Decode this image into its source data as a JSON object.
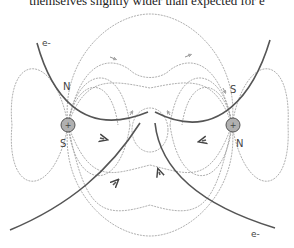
{
  "caption": "themselves slightly wider than expected for e",
  "diagram": {
    "labels": {
      "electron_top_left": "e-",
      "electron_bottom_right": "e-",
      "left_pole_north": "N",
      "left_pole_south": "S",
      "right_pole_south": "S",
      "right_pole_north": "N",
      "left_particle_sign": "+",
      "right_particle_sign": "+"
    },
    "colors": {
      "field_line": "#9a9a9a",
      "trajectory": "#555555",
      "particle_fill": "#b0b0b0",
      "text": "#444444"
    }
  }
}
